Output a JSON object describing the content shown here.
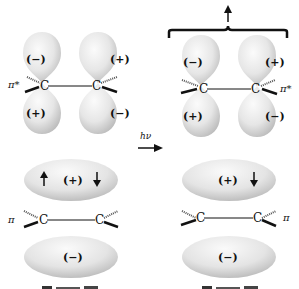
{
  "diagram": {
    "transition": {
      "label": "hν"
    },
    "ground_state": {
      "pi_star": {
        "label": "π*",
        "atoms": [
          "C",
          "C"
        ],
        "lobes": {
          "left_top": "(−)",
          "left_bottom": "(+)",
          "right_top": "(+)",
          "right_bottom": "(−)"
        }
      },
      "pi": {
        "label": "π",
        "atoms": [
          "C",
          "C"
        ],
        "upper_lobe": "(+)",
        "lower_lobe": "(−)",
        "electrons_upper": [
          "up-arrow",
          "down-arrow"
        ]
      }
    },
    "excited_state": {
      "pi_star": {
        "label": "π*",
        "atoms": [
          "C",
          "C"
        ],
        "lobes": {
          "left_top": "(−)",
          "left_bottom": "(+)",
          "right_top": "(+)",
          "right_bottom": "(−)"
        },
        "electron_above_brace": "up-arrow"
      },
      "pi": {
        "label": "π",
        "atoms": [
          "C",
          "C"
        ],
        "upper_lobe": "(+)",
        "lower_lobe": "(−)",
        "electrons_upper": [
          "down-arrow"
        ]
      }
    },
    "colors": {
      "lobe_light": "#f4f4f4",
      "lobe_dark": "#b9b9b9",
      "ink": "#111111"
    }
  }
}
